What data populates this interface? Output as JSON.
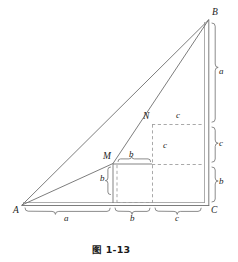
{
  "figure": {
    "caption": "图 1-13",
    "background_color": "#ffffff",
    "stroke_color": "#6e6e6e",
    "text_color": "#1c1c1c",
    "vertices": [
      {
        "name": "A",
        "label": "A",
        "x": 22,
        "y": 205
      },
      {
        "name": "B",
        "label": "B",
        "x": 209,
        "y": 19
      },
      {
        "name": "C",
        "label": "C",
        "x": 209,
        "y": 206
      },
      {
        "name": "M",
        "label": "M",
        "x": 113,
        "y": 163
      },
      {
        "name": "N",
        "label": "N",
        "x": 152,
        "y": 124
      }
    ],
    "segment_labels": {
      "bottom": [
        {
          "label": "a",
          "segment": "A-to-M-foot"
        },
        {
          "label": "b",
          "segment": "M-foot-to-N-foot"
        },
        {
          "label": "c",
          "segment": "N-foot-to-C"
        }
      ],
      "right": [
        {
          "label": "a",
          "segment": "B-to-N-level"
        },
        {
          "label": "c",
          "segment": "N-level-to-M-level"
        },
        {
          "label": "b",
          "segment": "M-level-to-C"
        }
      ],
      "interior": [
        {
          "label": "b",
          "position": "above-right-of-M"
        },
        {
          "label": "b",
          "position": "left-of-M-vertical"
        },
        {
          "label": "c",
          "position": "right-of-N"
        },
        {
          "label": "c",
          "position": "inside-middle-rectangle"
        }
      ]
    }
  }
}
